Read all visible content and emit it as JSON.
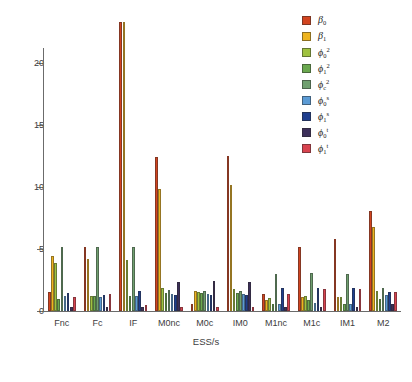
{
  "chart_data": {
    "type": "bar",
    "title": "",
    "subtitle": "",
    "xlabel": "ESS/s",
    "ylabel": "",
    "ylim": [
      0,
      23.5
    ],
    "grid": false,
    "legend_position": "top-right",
    "orientation": "vertical",
    "grouping": "grouped",
    "yticks": [
      0,
      5,
      10,
      15,
      20
    ],
    "ytick_labels": [
      "0",
      "5",
      "10",
      "15",
      "20"
    ],
    "categories": [
      "Fnc",
      "Fc",
      "IF",
      "M0nc",
      "M0c",
      "IM0",
      "M1nc",
      "M1c",
      "IM1",
      "M2"
    ],
    "series": [
      {
        "name": "beta_0",
        "label_base": "β",
        "label_sub": "0",
        "label_sup": "",
        "color": "#d2441f",
        "values": [
          1.5,
          5.15,
          23.3,
          12.45,
          0.55,
          12.5,
          1.4,
          5.15,
          5.8,
          8.05
        ]
      },
      {
        "name": "beta_1",
        "label_base": "β",
        "label_sub": "1",
        "label_sup": "",
        "color": "#eeb41f",
        "values": [
          4.45,
          4.2,
          23.3,
          9.85,
          1.65,
          10.15,
          0.85,
          1.1,
          1.15,
          6.75
        ]
      },
      {
        "name": "phi_0_sq",
        "label_base": "ϕ",
        "label_sub": "0",
        "label_sup": "2",
        "color": "#9fc23f",
        "values": [
          3.85,
          1.2,
          4.15,
          1.85,
          1.55,
          1.8,
          1.05,
          1.2,
          1.15,
          1.6
        ]
      },
      {
        "name": "phi_1_sq",
        "label_base": "ϕ",
        "label_sub": "1",
        "label_sup": "2",
        "color": "#6aa84f",
        "values": [
          1.0,
          1.25,
          1.2,
          1.45,
          1.45,
          1.45,
          0.55,
          0.9,
          0.6,
          0.95
        ]
      },
      {
        "name": "phi_c_sq",
        "label_base": "ϕ",
        "label_sub": "c",
        "label_sup": "2",
        "color": "#6f9f6f",
        "values": [
          5.2,
          5.15,
          5.2,
          1.7,
          1.6,
          1.65,
          3.0,
          3.05,
          3.0,
          1.85
        ]
      },
      {
        "name": "phi_0_s",
        "label_base": "ϕ",
        "label_sub": "0",
        "label_sup": "s",
        "color": "#5b9bd5",
        "values": [
          1.2,
          1.15,
          1.25,
          1.35,
          1.4,
          1.35,
          0.6,
          0.65,
          0.6,
          1.3
        ]
      },
      {
        "name": "phi_1_s",
        "label_base": "ϕ",
        "label_sub": "1",
        "label_sup": "s",
        "color": "#1f3f8f",
        "values": [
          1.45,
          1.3,
          1.6,
          1.3,
          1.3,
          1.3,
          1.85,
          1.85,
          1.85,
          1.5
        ]
      },
      {
        "name": "phi_0_t",
        "label_base": "ϕ",
        "label_sub": "0",
        "label_sup": "t",
        "color": "#3c2f5a",
        "values": [
          0.3,
          0.35,
          0.35,
          2.35,
          2.4,
          2.35,
          0.3,
          0.35,
          0.35,
          0.55
        ]
      },
      {
        "name": "phi_1_t",
        "label_base": "ϕ",
        "label_sub": "1",
        "label_sup": "t",
        "color": "#d8434f",
        "values": [
          1.15,
          1.4,
          0.45,
          0.3,
          0.35,
          0.3,
          1.35,
          1.75,
          1.8,
          1.5
        ]
      }
    ]
  }
}
